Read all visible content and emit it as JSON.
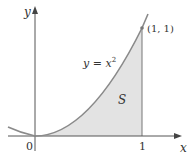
{
  "figure": {
    "curve_label": "y = x",
    "curve_exponent": "2",
    "region_label": "S",
    "point_label": "(1, 1)",
    "axis_labels": {
      "x": "x",
      "y": "y"
    },
    "ticks": {
      "origin": "0",
      "x_one": "1"
    }
  },
  "colors": {
    "curve": "#8a8a8a",
    "axis": "#555555",
    "fill": "#e3e3e3",
    "text": "#333333"
  }
}
